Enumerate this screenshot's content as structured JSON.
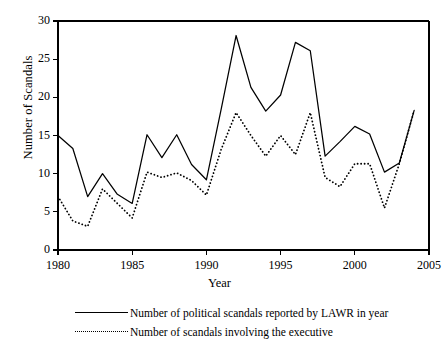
{
  "chart_data": {
    "type": "line",
    "title": "",
    "xlabel": "Year",
    "ylabel": "Number of Scandals",
    "xlim": [
      1980,
      2005
    ],
    "ylim": [
      0,
      30
    ],
    "xticks": [
      1980,
      1985,
      1990,
      1995,
      2000,
      2005
    ],
    "yticks": [
      0,
      5,
      10,
      15,
      20,
      25,
      30
    ],
    "grid": false,
    "legend_position": "below",
    "x": [
      1980,
      1981,
      1982,
      1983,
      1984,
      1985,
      1986,
      1987,
      1988,
      1989,
      1990,
      1991,
      1992,
      1993,
      1994,
      1995,
      1996,
      1997,
      1998,
      1999,
      2000,
      2001,
      2002,
      2003,
      2004
    ],
    "series": [
      {
        "name": "Number of political scandals reported by LAWR in year",
        "style": "solid",
        "values": [
          15,
          13.3,
          7,
          10,
          7.3,
          6.1,
          15.1,
          12.1,
          15.1,
          11.2,
          9.2,
          18.5,
          28.1,
          21.3,
          18.2,
          20.3,
          27.2,
          26.1,
          12.3,
          14.2,
          16.2,
          15.2,
          10.2,
          11.4,
          18.3
        ]
      },
      {
        "name": "Number of scandals involving the executive",
        "style": "dotted",
        "values": [
          7,
          3.8,
          3.1,
          8,
          6.1,
          4.2,
          10.2,
          9.5,
          10.1,
          9.1,
          7.2,
          13.2,
          18,
          15,
          12.3,
          15,
          12.5,
          18,
          9.5,
          8.3,
          11.3,
          11.3,
          5.5,
          11.3,
          18.3
        ]
      }
    ]
  },
  "axes": {
    "ylabel": "Number of Scandals",
    "xlabel": "Year",
    "ytick_labels": [
      "0",
      "5",
      "10",
      "15",
      "20",
      "25",
      "30"
    ],
    "xtick_labels": [
      "1980",
      "1985",
      "1990",
      "1995",
      "2000",
      "2005"
    ]
  },
  "legend": {
    "entries": [
      {
        "label": "Number of political scandals reported by LAWR in year",
        "style": "solid"
      },
      {
        "label": "Number of scandals involving the executive",
        "style": "dotted"
      }
    ]
  },
  "colors": {
    "line": "#000000",
    "axis": "#000000",
    "background": "#ffffff"
  }
}
